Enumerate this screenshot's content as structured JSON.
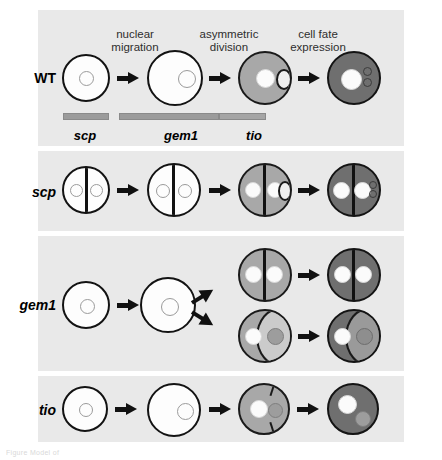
{
  "figure": {
    "kind": "developmental-biology-schematic",
    "caption_fragment": "Figure  Model of",
    "column_headers": [
      {
        "id": "nuclear-migration",
        "label": "nuclear\nmigration"
      },
      {
        "id": "asymmetric-division",
        "label": "asymmetric\ndivision"
      },
      {
        "id": "cell-fate-expression",
        "label": "cell fate\nexpression"
      }
    ],
    "rows": [
      {
        "id": "wt",
        "label": "WT",
        "italic": false
      },
      {
        "id": "scp",
        "label": "scp",
        "italic": true
      },
      {
        "id": "gem1",
        "label": "gem1",
        "italic": true
      },
      {
        "id": "tio",
        "label": "tio",
        "italic": true
      }
    ],
    "gene_bars": [
      {
        "id": "scp",
        "label": "scp",
        "stage_span": "nuclear migration"
      },
      {
        "id": "gem1",
        "label": "gem1",
        "stage_span": "nuclear migration to asymmetric division"
      },
      {
        "id": "tio",
        "label": "tio",
        "stage_span": "asymmetric division"
      }
    ],
    "colors": {
      "panel_background": "#e9e9e9",
      "page_background": "#ffffff",
      "cell_outline_fill": "#fdfdfd",
      "cell_mid_fill": "#a8a8a8",
      "cell_dark_fill": "#6f6f6f",
      "stroke": "#131313",
      "bar_fill": "#9b9b9b",
      "nucleus_white": "#fbfbfb",
      "nucleus_gray": "#9d9d9d"
    },
    "stage_count": 4,
    "arrow_glyph": "→"
  }
}
